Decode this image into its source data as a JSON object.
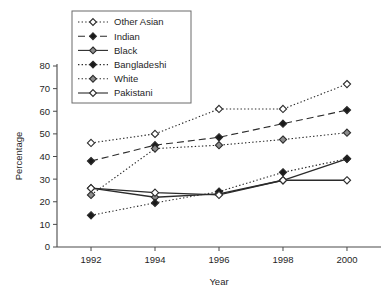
{
  "chart_data": {
    "type": "line",
    "title": "",
    "xlabel": "Year",
    "ylabel": "Percentage",
    "categories": [
      "1992",
      "1994",
      "1996",
      "1998",
      "2000"
    ],
    "x": [
      1992,
      1994,
      1996,
      1998,
      2000
    ],
    "xlim": [
      1991,
      2001
    ],
    "ylim": [
      0,
      80
    ],
    "yticks": [
      "0",
      "10",
      "20",
      "30",
      "40",
      "50",
      "60",
      "70",
      "80"
    ],
    "ytick_values": [
      0,
      10,
      20,
      30,
      40,
      50,
      60,
      70,
      80
    ],
    "grid": false,
    "legend_position": "upper-left-inset",
    "series": [
      {
        "name": "Other Asian",
        "values": [
          46,
          50,
          61,
          61,
          72
        ],
        "line_style": "dotted",
        "marker": "diamond-open",
        "color": "#2b2b2b"
      },
      {
        "name": "Indian",
        "values": [
          38,
          45,
          48.5,
          54.5,
          60.5
        ],
        "line_style": "dashed",
        "marker": "diamond-filled",
        "color": "#2b2b2b"
      },
      {
        "name": "Black",
        "values": [
          26,
          22,
          23.5,
          29.5,
          39
        ],
        "line_style": "solid",
        "marker": "diamond-gray",
        "color": "#2b2b2b"
      },
      {
        "name": "Bangladeshi",
        "values": [
          14,
          19.5,
          24.5,
          33,
          39
        ],
        "line_style": "dotted",
        "marker": "diamond-filled",
        "color": "#2b2b2b"
      },
      {
        "name": "White",
        "values": [
          23,
          43.5,
          45,
          47.5,
          50.5
        ],
        "line_style": "dotted",
        "marker": "diamond-gray",
        "color": "#2b2b2b"
      },
      {
        "name": "Pakistani",
        "values": [
          26,
          24,
          23,
          29.5,
          29.5
        ],
        "line_style": "solid",
        "marker": "diamond-open",
        "color": "#2b2b2b"
      }
    ]
  },
  "legend": {
    "entries": [
      {
        "label": "Other Asian"
      },
      {
        "label": "Indian"
      },
      {
        "label": "Black"
      },
      {
        "label": "Bangladeshi"
      },
      {
        "label": "White"
      },
      {
        "label": "Pakistani"
      }
    ]
  },
  "axes": {
    "y_title": "Percentage",
    "x_title": "Year"
  },
  "colors": {
    "ink": "#2b2b2b",
    "axis": "#4a4a4a",
    "marker_gray": "#8c8c8c",
    "background": "#ffffff"
  }
}
